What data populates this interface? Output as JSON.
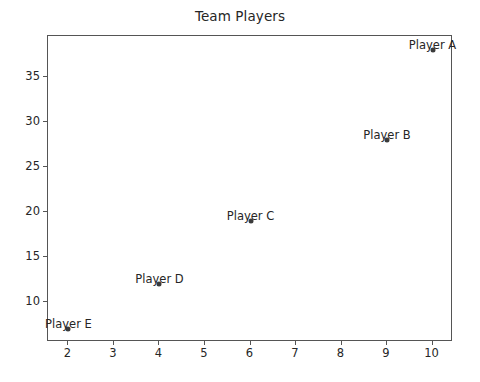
{
  "chart_data": {
    "type": "scatter",
    "title": "Team Players",
    "xlabel": "",
    "ylabel": "",
    "xlim": [
      1.55,
      10.45
    ],
    "ylim": [
      5.6,
      39.5
    ],
    "grid": false,
    "legend": "none",
    "marker_color": "#3b3b3b",
    "axis_color": "#555555",
    "text_color": "#262626",
    "xticks": [
      2,
      3,
      4,
      5,
      6,
      7,
      8,
      9,
      10
    ],
    "yticks": [
      10,
      15,
      20,
      25,
      30,
      35
    ],
    "xtick_labels": [
      "2",
      "3",
      "4",
      "5",
      "6",
      "7",
      "8",
      "9",
      "10"
    ],
    "ytick_labels": [
      "10",
      "15",
      "20",
      "25",
      "30",
      "35"
    ],
    "points": [
      {
        "label": "Player A",
        "x": 10,
        "y": 38
      },
      {
        "label": "Player B",
        "x": 9,
        "y": 28
      },
      {
        "label": "Player C",
        "x": 6,
        "y": 19
      },
      {
        "label": "Player D",
        "x": 4,
        "y": 12
      },
      {
        "label": "Player E",
        "x": 2,
        "y": 7
      }
    ],
    "annotations": [
      "Player A",
      "Player B",
      "Player C",
      "Player D",
      "Player E"
    ]
  }
}
